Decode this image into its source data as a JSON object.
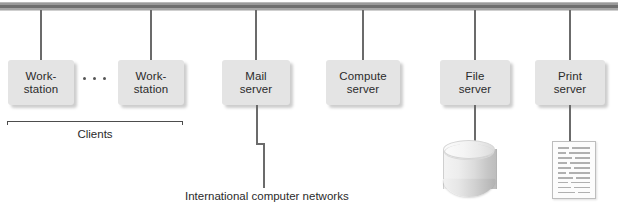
{
  "diagram": {
    "bus": {
      "name": "network-bus"
    },
    "nodes": [
      {
        "id": "workstation-1",
        "line1": "Work-",
        "line2": "station",
        "x": 8,
        "y": 60,
        "w": 66
      },
      {
        "id": "workstation-2",
        "line1": "Work-",
        "line2": "station",
        "x": 118,
        "y": 60,
        "w": 66
      },
      {
        "id": "mail-server",
        "line1": "Mail",
        "line2": "server",
        "x": 222,
        "y": 60,
        "w": 68
      },
      {
        "id": "compute-server",
        "line1": "Compute",
        "line2": "server",
        "x": 326,
        "y": 60,
        "w": 74
      },
      {
        "id": "file-server",
        "line1": "File",
        "line2": "server",
        "x": 440,
        "y": 60,
        "w": 70
      },
      {
        "id": "print-server",
        "line1": "Print",
        "line2": "server",
        "x": 535,
        "y": 60,
        "w": 70
      }
    ],
    "ellipsis": {
      "label": "...",
      "dots": 3
    },
    "clients_bracket": {
      "label": "Clients",
      "from_x": 7,
      "to_x": 182,
      "y": 121
    },
    "external_link": {
      "label": "International computer networks"
    },
    "file_server_icon": {
      "name": "disk-cylinder"
    },
    "print_server_icon": {
      "name": "printed-page",
      "rows": 10
    },
    "colors": {
      "box_fill": "#e4e4e4",
      "line": "#6b6b6b",
      "bus_core": "#6f6f6f",
      "text": "#2b2b2b",
      "background": "#ffffff"
    }
  }
}
